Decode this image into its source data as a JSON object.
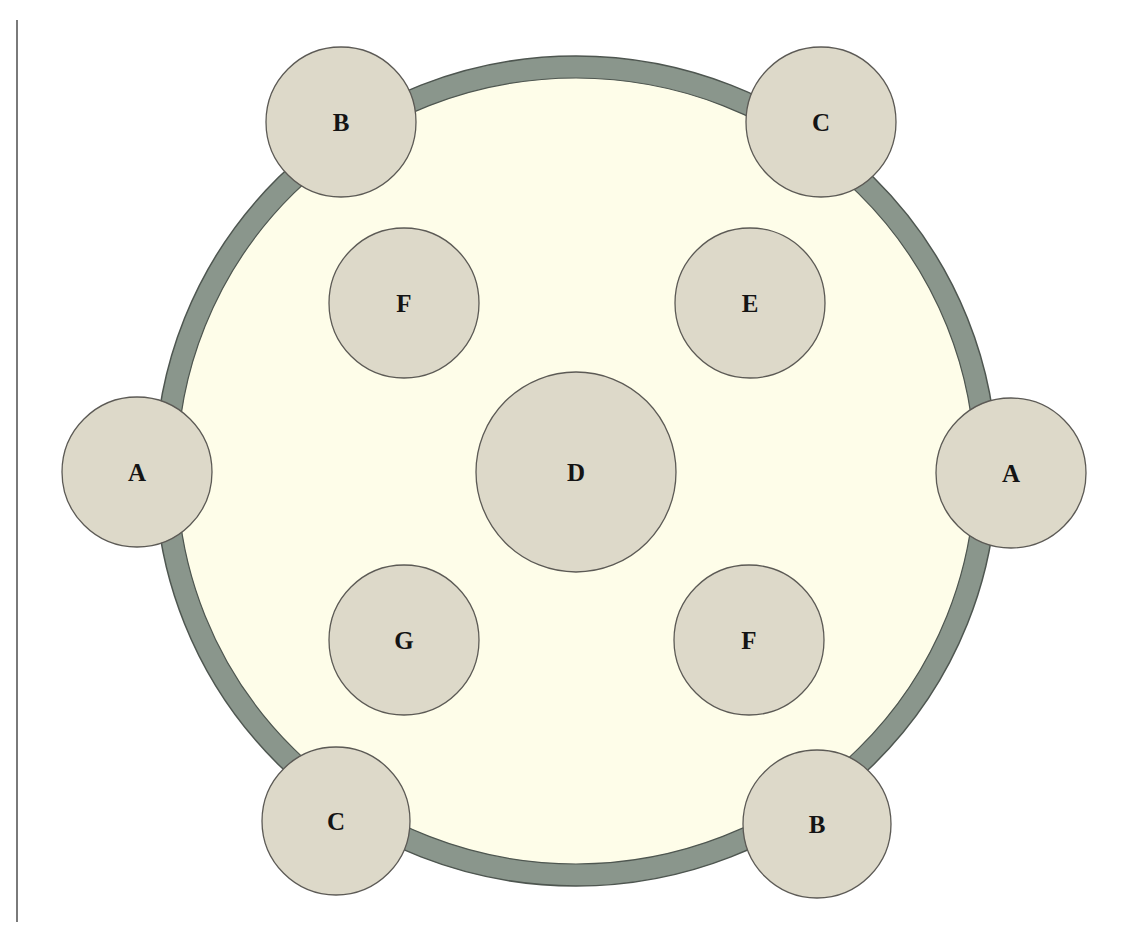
{
  "diagram": {
    "colors": {
      "background": "#ffffff",
      "ring_band": "#8a968c",
      "ring_outline": "#4e5650",
      "inner_fill": "#fefde9",
      "node_fill": "#ddd9c9",
      "node_outline": "#5c5a55",
      "label": "#141414",
      "margin_rule": "#7a7a7a"
    },
    "ring": {
      "cx": 576,
      "cy": 471,
      "outer_rx": 421,
      "outer_ry": 415,
      "band_width": 22
    },
    "nodes": [
      {
        "id": "node-a-left",
        "label": "A",
        "cx": 137,
        "cy": 472,
        "r": 75,
        "position": "ring-left"
      },
      {
        "id": "node-a-right",
        "label": "A",
        "cx": 1011,
        "cy": 473,
        "r": 75,
        "position": "ring-right"
      },
      {
        "id": "node-b-top",
        "label": "B",
        "cx": 341,
        "cy": 122,
        "r": 75,
        "position": "ring-top-left"
      },
      {
        "id": "node-c-top",
        "label": "C",
        "cx": 821,
        "cy": 122,
        "r": 75,
        "position": "ring-top-right"
      },
      {
        "id": "node-c-bottom",
        "label": "C",
        "cx": 336,
        "cy": 821,
        "r": 74,
        "position": "ring-bottom-left"
      },
      {
        "id": "node-b-bottom",
        "label": "B",
        "cx": 817,
        "cy": 824,
        "r": 74,
        "position": "ring-bottom-right"
      },
      {
        "id": "node-f-upper",
        "label": "F",
        "cx": 404,
        "cy": 303,
        "r": 75,
        "position": "inner-upper-left"
      },
      {
        "id": "node-e",
        "label": "E",
        "cx": 750,
        "cy": 303,
        "r": 75,
        "position": "inner-upper-right"
      },
      {
        "id": "node-d",
        "label": "D",
        "cx": 576,
        "cy": 472,
        "r": 100,
        "position": "center"
      },
      {
        "id": "node-g",
        "label": "G",
        "cx": 404,
        "cy": 640,
        "r": 75,
        "position": "inner-lower-left"
      },
      {
        "id": "node-f-lower",
        "label": "F",
        "cx": 749,
        "cy": 640,
        "r": 75,
        "position": "inner-lower-right"
      }
    ]
  }
}
